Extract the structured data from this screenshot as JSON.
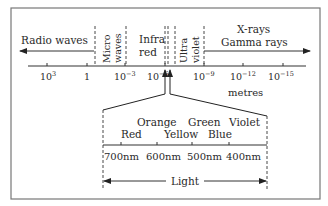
{
  "diagram": {
    "regions": {
      "radio": "Radio waves",
      "micro_1": "Micro",
      "micro_2": "waves",
      "infra_1": "Infra",
      "infra_2": "red",
      "ultra_1": "Ultra",
      "ultra_2": "violet",
      "xray": "X-rays",
      "gamma": "Gamma rays"
    },
    "ticks": {
      "t1": "10",
      "t1_exp": "3",
      "t2": "1",
      "t3": "10",
      "t3_exp": "−3",
      "t4": "10",
      "t4_exp": "−6",
      "t5": "10",
      "t5_exp": "−9",
      "t6": "10",
      "t6_exp": "−12",
      "t7": "10",
      "t7_exp": "−15"
    },
    "unit": "metres",
    "colors": {
      "red": "Red",
      "orange": "Orange",
      "yellow": "Yellow",
      "green": "Green",
      "blue": "Blue",
      "violet": "Violet"
    },
    "wavelengths": {
      "w700": "700nm",
      "w600": "600nm",
      "w500": "500nm",
      "w400": "400nm"
    },
    "light_label": "Light",
    "stroke_color": "#333333",
    "frame_color": "#777777"
  }
}
